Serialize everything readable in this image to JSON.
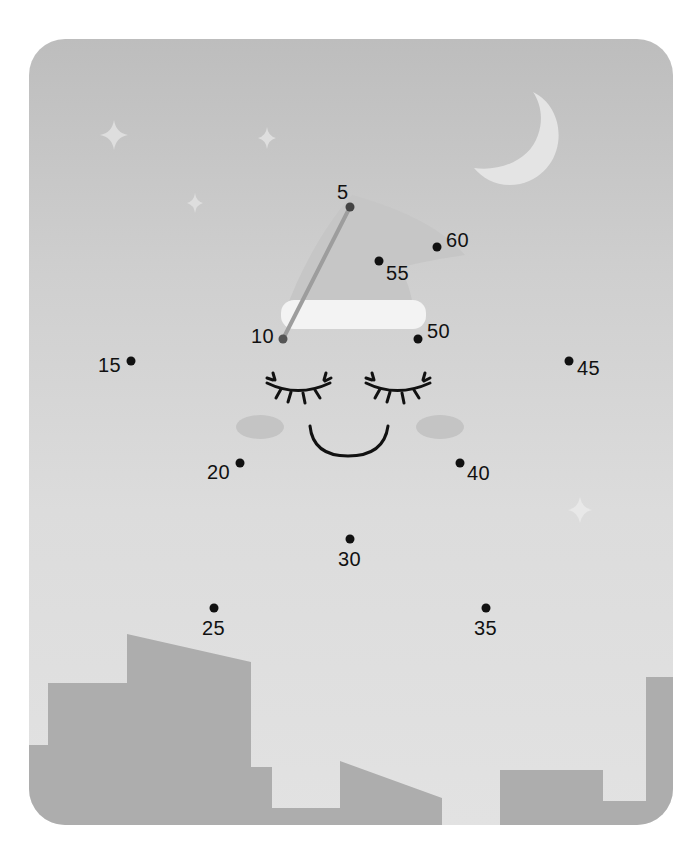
{
  "puzzle": {
    "type": "connect-the-dots",
    "theme": "sleeping star with nightcap over city skyline",
    "colors": {
      "sky_top": "#bdbdbd",
      "sky_bottom": "#e2e2e2",
      "buildings": "#adadad",
      "moon": "#e6e6e6",
      "hat": "#c4c4c4",
      "hat_brim": "#f4f4f4",
      "cheeks": "#c6c6c6",
      "dots": "#111111",
      "drawn_line": "#9a9a9a"
    },
    "dots": [
      {
        "number": "5",
        "x": 350,
        "y": 207
      },
      {
        "number": "10",
        "x": 283,
        "y": 339
      },
      {
        "number": "15",
        "x": 131,
        "y": 361
      },
      {
        "number": "20",
        "x": 240,
        "y": 463
      },
      {
        "number": "25",
        "x": 214,
        "y": 608
      },
      {
        "number": "30",
        "x": 350,
        "y": 539
      },
      {
        "number": "35",
        "x": 486,
        "y": 608
      },
      {
        "number": "40",
        "x": 460,
        "y": 463
      },
      {
        "number": "45",
        "x": 569,
        "y": 361
      },
      {
        "number": "50",
        "x": 418,
        "y": 339
      },
      {
        "number": "55",
        "x": 379,
        "y": 261
      },
      {
        "number": "60",
        "x": 437,
        "y": 247
      }
    ],
    "drawn_segments": [
      {
        "from": "5",
        "to": "10"
      }
    ]
  },
  "labels": {
    "d5": "5",
    "d10": "10",
    "d15": "15",
    "d20": "20",
    "d25": "25",
    "d30": "30",
    "d35": "35",
    "d40": "40",
    "d45": "45",
    "d50": "50",
    "d55": "55",
    "d60": "60"
  }
}
